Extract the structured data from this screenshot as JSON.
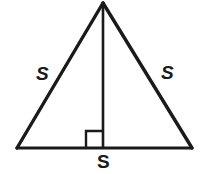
{
  "figure": {
    "type": "geometry-diagram",
    "shape_name": "equilateral-triangle",
    "background_color": "#ffffff",
    "stroke_color": "#1a1a1a",
    "labels": {
      "left_side": "S",
      "right_side": "S",
      "base_side": "S"
    },
    "markers": {
      "right_angle": "right-angle-square"
    },
    "geometry": {
      "apex": [
        103,
        3
      ],
      "bottom_left": [
        17,
        148
      ],
      "bottom_right": [
        192,
        148
      ],
      "altitude_foot": [
        103,
        148
      ],
      "right_angle_square": [
        86,
        131,
        17,
        17
      ],
      "stroke_width": 3
    }
  }
}
